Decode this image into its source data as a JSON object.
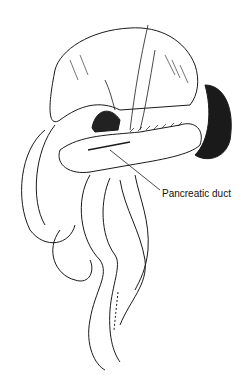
{
  "figure": {
    "labels": [
      {
        "text": "Pancreatic duct",
        "target": "pancreatic-duct"
      }
    ],
    "colors": {
      "ink": "#111111",
      "background": "#ffffff"
    }
  }
}
